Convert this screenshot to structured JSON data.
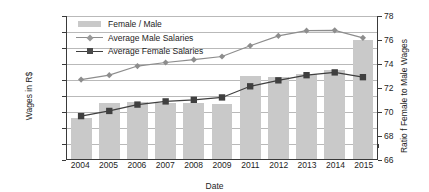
{
  "chart_data": {
    "type": "bar",
    "title": "",
    "xlabel": "Date",
    "ylabel": "Wages in R$",
    "ylabel_secondary": "Ratio f Female to Male Wages",
    "categories": [
      "2004",
      "2005",
      "2006",
      "2007",
      "2008",
      "2009",
      "2011",
      "2012",
      "2013",
      "2014",
      "2015"
    ],
    "ylim": [
      500,
      2300
    ],
    "ytick_step": 200,
    "yticks": [
      "500",
      "700",
      "900",
      "1,100",
      "1,300",
      "1,500",
      "1,700",
      "1,900",
      "2,100",
      "2,300"
    ],
    "ylim_secondary": [
      66,
      78
    ],
    "ytick_step_secondary": 2,
    "yticks_secondary": [
      "66",
      "68",
      "70",
      "72",
      "74",
      "76",
      "78"
    ],
    "grid": true,
    "legend_position": "top-left",
    "series": [
      {
        "name": "Female / Male",
        "type": "bar",
        "axis": "secondary",
        "color": "#c9c9c9",
        "values": [
          69.4,
          70.7,
          70.8,
          70.7,
          70.7,
          70.6,
          73.0,
          72.9,
          73.1,
          73.5,
          76.0
        ]
      },
      {
        "name": "Average Male Salaries",
        "type": "line",
        "axis": "primary",
        "color": "#8d8d8d",
        "marker": "diamond",
        "values": [
          1500,
          1555,
          1670,
          1715,
          1750,
          1790,
          1925,
          2050,
          2115,
          2120,
          2025
        ]
      },
      {
        "name": "Average Female Salaries",
        "type": "line",
        "axis": "primary",
        "color": "#3f3f3f",
        "marker": "square",
        "values": [
          1040,
          1105,
          1185,
          1225,
          1245,
          1275,
          1415,
          1490,
          1555,
          1590,
          1530
        ]
      }
    ]
  },
  "legend": {
    "items": [
      {
        "label": "Female / Male",
        "key": "bar-swatch"
      },
      {
        "label": "Average Male Salaries",
        "key": "diamond-marker"
      },
      {
        "label": "Average Female Salaries",
        "key": "square-marker"
      }
    ]
  },
  "colors": {
    "bar_fill": "#c9c9c9",
    "male_line": "#8d8d8d",
    "female_line": "#3f3f3f",
    "axis": "#3a3a3a",
    "gridline": "#b9b9b9",
    "text": "#1d1d1d"
  }
}
